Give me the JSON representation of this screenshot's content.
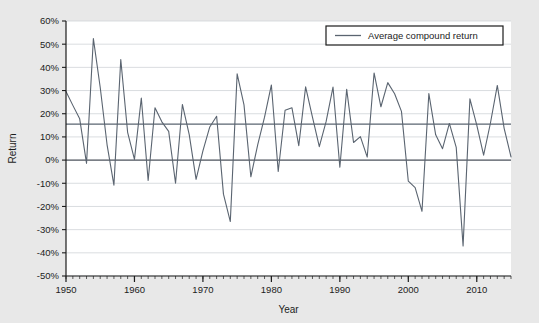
{
  "chart_data": {
    "type": "line",
    "title": "",
    "xlabel": "Year",
    "ylabel": "Return",
    "xlim": [
      1950,
      2015
    ],
    "ylim": [
      -0.5,
      0.6
    ],
    "grid": true,
    "legend_position": "top-right",
    "y_tick_labels": [
      "60%",
      "50%",
      "40%",
      "30%",
      "20%",
      "10%",
      "0%",
      "-10%",
      "-20%",
      "-30%",
      "-40%",
      "-50%"
    ],
    "y_tick_values": [
      0.6,
      0.5,
      0.4,
      0.3,
      0.2,
      0.1,
      0.0,
      -0.1,
      -0.2,
      -0.3,
      -0.4,
      -0.5
    ],
    "x_tick_labels": [
      "1950",
      "1960",
      "1970",
      "1980",
      "1990",
      "2000",
      "2010"
    ],
    "x_tick_values": [
      1950,
      1960,
      1970,
      1980,
      1990,
      2000,
      2010
    ],
    "x_minor_tick_step": 1,
    "series": [
      {
        "name": "Annual return",
        "color": "#5a6470",
        "x": [
          1950,
          1951,
          1952,
          1953,
          1954,
          1955,
          1956,
          1957,
          1958,
          1959,
          1960,
          1961,
          1962,
          1963,
          1964,
          1965,
          1966,
          1967,
          1968,
          1969,
          1970,
          1971,
          1972,
          1973,
          1974,
          1975,
          1976,
          1977,
          1978,
          1979,
          1980,
          1981,
          1982,
          1983,
          1984,
          1985,
          1986,
          1987,
          1988,
          1989,
          1990,
          1991,
          1992,
          1993,
          1994,
          1995,
          1996,
          1997,
          1998,
          1999,
          2000,
          2001,
          2002,
          2003,
          2004,
          2005,
          2006,
          2007,
          2008,
          2009,
          2010,
          2011,
          2012,
          2013,
          2014,
          2015
        ],
        "values": [
          0.296,
          0.236,
          0.178,
          -0.014,
          0.524,
          0.313,
          0.066,
          -0.108,
          0.434,
          0.12,
          0.003,
          0.268,
          -0.088,
          0.226,
          0.165,
          0.124,
          -0.1,
          0.24,
          0.11,
          -0.083,
          0.04,
          0.143,
          0.189,
          -0.147,
          -0.265,
          0.372,
          0.238,
          -0.072,
          0.066,
          0.185,
          0.324,
          -0.049,
          0.215,
          0.226,
          0.062,
          0.316,
          0.185,
          0.058,
          0.167,
          0.315,
          -0.031,
          0.305,
          0.076,
          0.101,
          0.013,
          0.376,
          0.23,
          0.334,
          0.286,
          0.21,
          -0.091,
          -0.119,
          -0.221,
          0.287,
          0.109,
          0.049,
          0.158,
          0.055,
          -0.37,
          0.264,
          0.151,
          0.021,
          0.16,
          0.322,
          0.137,
          0.014
        ]
      }
    ],
    "reference_lines": [
      {
        "name": "Average compound return",
        "value": 0.155,
        "color": "#5a6470",
        "orientation": "horizontal"
      },
      {
        "name": "Zero line",
        "value": 0.0,
        "color": "#555b63",
        "orientation": "horizontal"
      }
    ],
    "legend": [
      {
        "label": "Average compound return",
        "color": "#5a6470"
      }
    ]
  }
}
